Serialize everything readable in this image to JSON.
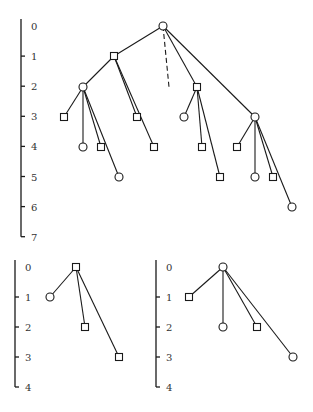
{
  "diagram": {
    "type": "game-trees",
    "node_shapes": {
      "circle": "circle-node",
      "square": "square-node"
    },
    "colors": {
      "stroke": "#1a1a1a",
      "text": "#333333",
      "background": "#ffffff"
    },
    "trees": [
      {
        "id": "main-tree",
        "axis": {
          "x": 21,
          "y0": 26,
          "step": 30.1,
          "labels": [
            "0",
            "1",
            "2",
            "3",
            "4",
            "5",
            "6",
            "7"
          ]
        },
        "nodes": [
          {
            "id": "r",
            "shape": "circle",
            "x": 163,
            "y": 26,
            "depth": 0
          },
          {
            "id": "a",
            "shape": "square",
            "x": 114,
            "y": 56,
            "depth": 1
          },
          {
            "id": "b",
            "shape": "circle",
            "x": 83,
            "y": 87,
            "depth": 2
          },
          {
            "id": "c",
            "shape": "square",
            "x": 197,
            "y": 87,
            "depth": 2
          },
          {
            "id": "d",
            "shape": "circle",
            "x": 255,
            "y": 117,
            "depth": 3
          },
          {
            "id": "b1",
            "shape": "square",
            "x": 64,
            "y": 117,
            "depth": 3
          },
          {
            "id": "b2",
            "shape": "circle",
            "x": 83,
            "y": 147,
            "depth": 4
          },
          {
            "id": "b3",
            "shape": "square",
            "x": 101,
            "y": 147,
            "depth": 4
          },
          {
            "id": "b4",
            "shape": "circle",
            "x": 119,
            "y": 177,
            "depth": 5
          },
          {
            "id": "a2",
            "shape": "square",
            "x": 137,
            "y": 117,
            "depth": 3
          },
          {
            "id": "a3",
            "shape": "square",
            "x": 154,
            "y": 147,
            "depth": 4
          },
          {
            "id": "c1",
            "shape": "circle",
            "x": 184,
            "y": 117,
            "depth": 3
          },
          {
            "id": "c2",
            "shape": "square",
            "x": 202,
            "y": 147,
            "depth": 4
          },
          {
            "id": "c3",
            "shape": "square",
            "x": 220,
            "y": 177,
            "depth": 5
          },
          {
            "id": "d1",
            "shape": "square",
            "x": 237,
            "y": 147,
            "depth": 4
          },
          {
            "id": "d2",
            "shape": "circle",
            "x": 255,
            "y": 177,
            "depth": 5
          },
          {
            "id": "d3",
            "shape": "square",
            "x": 273,
            "y": 177,
            "depth": 5
          },
          {
            "id": "d4",
            "shape": "circle",
            "x": 292,
            "y": 207,
            "depth": 6
          }
        ],
        "edges": [
          [
            "r",
            "a"
          ],
          [
            "r",
            "c"
          ],
          [
            "r",
            "d"
          ],
          [
            "a",
            "b"
          ],
          [
            "a",
            "a2"
          ],
          [
            "a",
            "a3"
          ],
          [
            "b",
            "b1"
          ],
          [
            "b",
            "b2"
          ],
          [
            "b",
            "b3"
          ],
          [
            "b",
            "b4"
          ],
          [
            "c",
            "c1"
          ],
          [
            "c",
            "c2"
          ],
          [
            "c",
            "c3"
          ],
          [
            "d",
            "d1"
          ],
          [
            "d",
            "d2"
          ],
          [
            "d",
            "d3"
          ],
          [
            "d",
            "d4"
          ]
        ],
        "dashed_edges": [
          {
            "from": "r",
            "x2": 169,
            "y2": 87
          }
        ]
      },
      {
        "id": "small-tree-left",
        "axis": {
          "x": 15,
          "y0": 267,
          "step": 30,
          "labels": [
            "0",
            "1",
            "2",
            "3",
            "4"
          ]
        },
        "nodes": [
          {
            "id": "r",
            "shape": "square",
            "x": 76,
            "y": 267,
            "depth": 0
          },
          {
            "id": "n1",
            "shape": "circle",
            "x": 50,
            "y": 297,
            "depth": 1
          },
          {
            "id": "n2",
            "shape": "square",
            "x": 85,
            "y": 327,
            "depth": 2
          },
          {
            "id": "n3",
            "shape": "square",
            "x": 119,
            "y": 357,
            "depth": 3
          }
        ],
        "edges": [
          [
            "r",
            "n1"
          ],
          [
            "r",
            "n2"
          ],
          [
            "r",
            "n3"
          ]
        ],
        "dashed_edges": []
      },
      {
        "id": "small-tree-right",
        "axis": {
          "x": 156,
          "y0": 267,
          "step": 30,
          "labels": [
            "0",
            "1",
            "2",
            "3",
            "4"
          ]
        },
        "nodes": [
          {
            "id": "r",
            "shape": "circle",
            "x": 223,
            "y": 267,
            "depth": 0
          },
          {
            "id": "n1",
            "shape": "square",
            "x": 189,
            "y": 297,
            "depth": 1
          },
          {
            "id": "n2",
            "shape": "circle",
            "x": 223,
            "y": 327,
            "depth": 2
          },
          {
            "id": "n3",
            "shape": "square",
            "x": 257,
            "y": 327,
            "depth": 2
          },
          {
            "id": "n4",
            "shape": "circle",
            "x": 293,
            "y": 357,
            "depth": 3
          }
        ],
        "edges": [
          [
            "r",
            "n1"
          ],
          [
            "r",
            "n2"
          ],
          [
            "r",
            "n3"
          ],
          [
            "r",
            "n4"
          ]
        ],
        "dashed_edges": []
      }
    ]
  }
}
